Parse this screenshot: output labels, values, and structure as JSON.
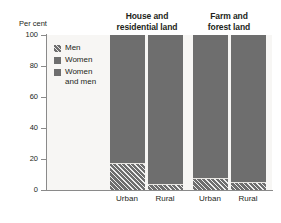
{
  "chart_data": {
    "type": "bar",
    "title": "",
    "subtitle": "",
    "stacked": true,
    "orientation": "vertical",
    "xlabel": "",
    "ylabel": "Per cent",
    "ylim": [
      0,
      100
    ],
    "yticks": [
      0,
      20,
      40,
      60,
      80,
      100
    ],
    "ytick_labels": [
      "0",
      "20",
      "40",
      "60",
      "80",
      "100"
    ],
    "grid": false,
    "legend_position": "inside-upper-left",
    "groups": [
      {
        "label_lines": [
          "House and",
          "residential land"
        ],
        "label": "House and residential land"
      },
      {
        "label_lines": [
          "Farm and",
          "forest land"
        ],
        "label": "Farm and forest land"
      }
    ],
    "categories": [
      "Urban",
      "Rural",
      "Urban",
      "Rural"
    ],
    "series": [
      {
        "name": "Men",
        "pattern": "hatch",
        "color": "#6e6e6e",
        "values": [
          17.5,
          4,
          7.5,
          5
        ]
      },
      {
        "name": "Women",
        "pattern": "solid",
        "color": "#6e6e6e",
        "values": [
          0,
          0,
          0,
          0
        ]
      },
      {
        "name": "Women and men",
        "pattern": "solid",
        "color": "#6e6e6e",
        "values": [
          82.5,
          96,
          92.5,
          95
        ]
      }
    ],
    "legend": [
      {
        "label": "Men",
        "pattern": "hatch",
        "color": "#6e6e6e"
      },
      {
        "label": "Women",
        "pattern": "solid",
        "color": "#6e6e6e"
      },
      {
        "label": "Women\nand men",
        "pattern": "solid",
        "color": "#6e6e6e"
      }
    ],
    "bars": [
      {
        "category": "Urban",
        "group": "House and residential land",
        "men": 17.5,
        "women_and_men": 82.5,
        "total": 100
      },
      {
        "category": "Rural",
        "group": "House and residential land",
        "men": 4,
        "women_and_men": 96,
        "total": 100
      },
      {
        "category": "Urban",
        "group": "Farm and forest land",
        "men": 7.5,
        "women_and_men": 92.5,
        "total": 100
      },
      {
        "category": "Rural",
        "group": "Farm and forest land",
        "men": 5,
        "women_and_men": 95,
        "total": 100
      }
    ],
    "colors": {
      "bar_fill": "#6e6e6e",
      "plot_background": "#f7f6f4",
      "axis": "#8a8a8a",
      "text": "#231f20",
      "page_background": "#ffffff"
    }
  },
  "axis": {
    "y_title": "Per cent"
  },
  "headers": {
    "group0_line0": "House and",
    "group0_line1": "residential land",
    "group1_line0": "Farm and",
    "group1_line1": "forest land"
  },
  "yticks": {
    "t0": "0",
    "t20": "20",
    "t40": "40",
    "t60": "60",
    "t80": "80",
    "t100": "100"
  },
  "xlabels": {
    "b0": "Urban",
    "b1": "Rural",
    "b2": "Urban",
    "b3": "Rural"
  },
  "legend": {
    "item0": "Men",
    "item1": "Women",
    "item2": "Women\nand men"
  }
}
